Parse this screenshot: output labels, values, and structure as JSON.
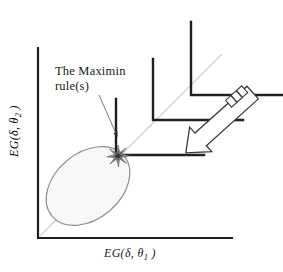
{
  "figure": {
    "title_cut_off": "",
    "background_color": "#ffffff",
    "line_color": "#1a1a1a",
    "faint_line_color": "#c9c9c9",
    "ellipse_fill": "#f4f4f4",
    "ellipse_stroke": "#8a8a8a"
  },
  "annotation": {
    "line1": "The Maximin",
    "line2": "rule(s)",
    "leader_from": [
      100,
      96
    ],
    "leader_to": [
      119,
      139
    ]
  },
  "axes": {
    "x_label_prefix": "EG(",
    "x_label_delta": "δ",
    "x_label_comma": ",",
    "x_label_theta": "θ",
    "x_label_sub": "1",
    "x_label_suffix": ")",
    "x_label_full": "EG( δ, θ₁ )",
    "y_label_prefix": "EG(",
    "y_label_delta": "δ",
    "y_label_comma": ",",
    "y_label_theta": "θ",
    "y_label_sub": "2",
    "y_label_suffix": ")",
    "y_label_full": "EG( δ, θ₂ )",
    "origin": [
      38,
      238
    ],
    "x_axis_end": [
      232,
      238
    ],
    "y_axis_top": [
      38,
      48
    ]
  },
  "diagonal": {
    "from": [
      40,
      236
    ],
    "to": [
      222,
      54
    ],
    "note": "45 degree equal-expected-gain line"
  },
  "risk_set": {
    "shape": "ellipse",
    "center": [
      88,
      186
    ],
    "rx": 47,
    "ry": 33,
    "rotation_deg": -40,
    "fill_pattern": "stipple"
  },
  "indifference_curves": [
    {
      "name": "inner-corner",
      "corner": [
        116,
        155
      ],
      "v_top": [
        116,
        99
      ],
      "h_right": [
        204,
        155
      ]
    },
    {
      "name": "middle-corner",
      "corner": [
        153,
        120
      ],
      "v_top": [
        153,
        59
      ],
      "h_right": [
        243,
        120
      ]
    },
    {
      "name": "outer-corner",
      "corner": [
        191,
        95
      ],
      "v_top": [
        191,
        22
      ],
      "h_right": [
        283,
        95
      ]
    }
  ],
  "tangency_marker": {
    "name": "starburst",
    "position": [
      118,
      156
    ]
  },
  "callout_arrow": {
    "name": "block-arrow",
    "tip": [
      182,
      156
    ],
    "tail": [
      253,
      92
    ],
    "style": "hollow-outline-with-striped-tail"
  }
}
